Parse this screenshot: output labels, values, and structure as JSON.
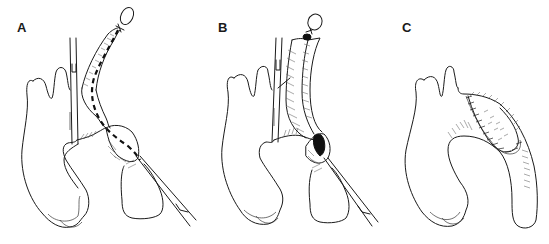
{
  "figure": {
    "panels": [
      {
        "label": "A",
        "content": "Aortic arch with clamp on left; vessel segment with dashed line through lumen, balloon-like dilated segment and catheter/instrument inserted at lower right; tied-off tip at top"
      },
      {
        "label": "B",
        "content": "Same anatomy with vessel opened lengthwise showing hatched inner wall, dark opening at dilated segment, instrument at lower right; tied tip at top"
      },
      {
        "label": "C",
        "content": "Completed repair: aortic arch with hatched patch sewn along the arch with cross-stitch suture line"
      }
    ]
  },
  "colors": {
    "line": "#1a1a1a",
    "background": "#ffffff"
  }
}
